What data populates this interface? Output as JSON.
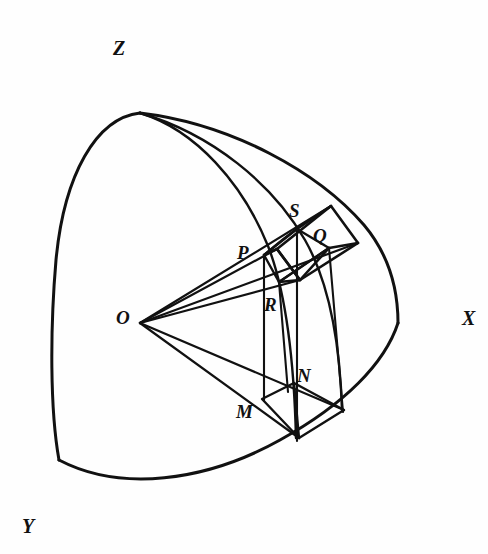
{
  "figure": {
    "kind": "geometry-diagram",
    "stroke_color": "#111111",
    "background_color": "#fefefe"
  },
  "axes": {
    "x": {
      "label": "X",
      "label_pos": {
        "x": 462,
        "y": 308
      },
      "line": {
        "x1": 140,
        "y1": 323,
        "x2": 472,
        "y2": 323
      }
    },
    "y": {
      "label": "Y",
      "label_pos": {
        "x": 22,
        "y": 516
      },
      "line": {
        "x1": 140,
        "y1": 323,
        "x2": 11,
        "y2": 548
      }
    },
    "z": {
      "label": "Z",
      "label_pos": {
        "x": 113,
        "y": 38
      },
      "line": {
        "x1": 140,
        "y1": 323,
        "x2": 140,
        "y2": 5
      }
    }
  },
  "points": {
    "O": {
      "label": "O",
      "label_pos": {
        "x": 116,
        "y": 308
      },
      "x": 140,
      "y": 323
    },
    "P": {
      "label": "P",
      "label_pos": {
        "x": 237,
        "y": 243
      },
      "x": 264,
      "y": 255
    },
    "S": {
      "label": "S",
      "label_pos": {
        "x": 289,
        "y": 201
      },
      "x": 297,
      "y": 229
    },
    "Q": {
      "label": "Q",
      "label_pos": {
        "x": 313,
        "y": 226
      },
      "x": 329,
      "y": 248
    },
    "R": {
      "label": "R",
      "label_pos": {
        "x": 264,
        "y": 295
      },
      "x": 279,
      "y": 282
    },
    "M": {
      "label": "M",
      "label_pos": {
        "x": 236,
        "y": 402
      },
      "x": 262,
      "y": 399
    },
    "N": {
      "label": "N",
      "label_pos": {
        "x": 297,
        "y": 366
      },
      "x": 294,
      "y": 383
    },
    "pole": {
      "x": 140,
      "y": 113
    },
    "x_sphere": {
      "x": 398,
      "y": 323
    },
    "y_sphere": {
      "x": 59,
      "y": 460
    }
  },
  "labels_order": [
    "Z",
    "X",
    "Y",
    "O",
    "P",
    "S",
    "Q",
    "R",
    "M",
    "N"
  ],
  "element": {
    "surface_patch_vertices": [
      "P",
      "S",
      "Q",
      "R"
    ],
    "base_patch_vertices": [
      "M",
      "N"
    ],
    "radial_rays": [
      "O-P",
      "O-S",
      "O-Q",
      "O-R",
      "O-M",
      "O-N"
    ]
  }
}
